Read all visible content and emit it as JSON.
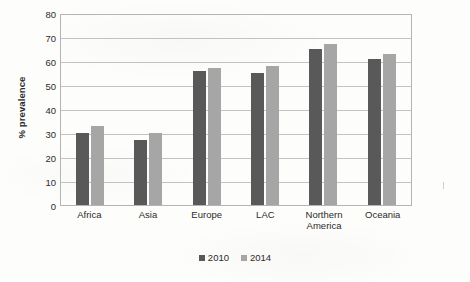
{
  "chart_data": {
    "type": "bar",
    "title": "",
    "xlabel": "",
    "ylabel": "% prevalence",
    "ylim": [
      0,
      80
    ],
    "ytick_step": 10,
    "yticks": [
      80,
      70,
      60,
      50,
      40,
      30,
      20,
      10,
      0
    ],
    "grid": true,
    "legend_position": "bottom",
    "categories": [
      "Africa",
      "Asia",
      "Europe",
      "LAC",
      "Northern America",
      "Oceania"
    ],
    "category_labels": [
      "Africa",
      "Asia",
      "Europe",
      "LAC",
      "Northern\nAmerica",
      "Oceania"
    ],
    "series": [
      {
        "name": "2010",
        "color": "#595959",
        "values": [
          30,
          27,
          56,
          55,
          65,
          61
        ]
      },
      {
        "name": "2014",
        "color": "#a6a6a6",
        "values": [
          33,
          30,
          57,
          58,
          67,
          63
        ]
      }
    ]
  },
  "legend": {
    "items": [
      {
        "label": "2010"
      },
      {
        "label": "2014"
      }
    ]
  },
  "colors": {
    "series_2010": "#595959",
    "series_2014": "#a6a6a6",
    "gridline": "#c2c2c2",
    "axis": "#b4b4b4",
    "background": "#fdfdfb",
    "text": "#2b2b2b"
  }
}
